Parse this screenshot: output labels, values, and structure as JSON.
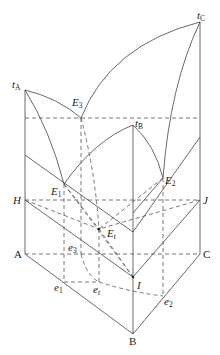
{
  "diagram": {
    "points": {
      "tA": {
        "label": "t",
        "sub": "A"
      },
      "tB": {
        "label": "t",
        "sub": "B"
      },
      "tC": {
        "label": "t",
        "sub": "C"
      },
      "E1": {
        "label": "E",
        "sub": "1"
      },
      "E2": {
        "label": "E",
        "sub": "2"
      },
      "E3": {
        "label": "E",
        "sub": "3"
      },
      "Et": {
        "label": "E",
        "sub": "t"
      },
      "H": {
        "label": "H"
      },
      "J": {
        "label": "J"
      },
      "I": {
        "label": "I"
      },
      "A": {
        "label": "A"
      },
      "B": {
        "label": "B"
      },
      "C": {
        "label": "C"
      },
      "e1": {
        "label": "e",
        "sub": "1"
      },
      "e2": {
        "label": "e",
        "sub": "2"
      },
      "e3": {
        "label": "e",
        "sub": "3"
      },
      "et": {
        "label": "e",
        "sub": "t"
      }
    }
  }
}
